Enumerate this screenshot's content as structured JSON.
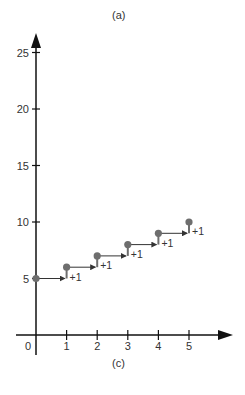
{
  "chart_data": {
    "type": "scatter",
    "title": "(a)",
    "caption": "(c)",
    "xlabel": "",
    "ylabel": "",
    "x": [
      0,
      1,
      2,
      3,
      4,
      5
    ],
    "values": [
      5,
      6,
      7,
      8,
      9,
      10
    ],
    "series": [
      {
        "name": "points",
        "x": [
          0,
          1,
          2,
          3,
          4,
          5
        ],
        "values": [
          5,
          6,
          7,
          8,
          9,
          10
        ]
      }
    ],
    "step_annotations": [
      "+1",
      "+1",
      "+1",
      "+1",
      "+1"
    ],
    "x_ticks": [
      "0",
      "1",
      "2",
      "3",
      "4",
      "5"
    ],
    "y_ticks": [
      "5",
      "10",
      "15",
      "20",
      "25"
    ],
    "xlim": [
      0,
      6.3
    ],
    "ylim": [
      0,
      26.5
    ],
    "grid": false,
    "legend": null,
    "colors": {
      "point": "#6e6e6e",
      "axis": "#111111",
      "arrow": "#333333",
      "text": "#333333"
    }
  }
}
